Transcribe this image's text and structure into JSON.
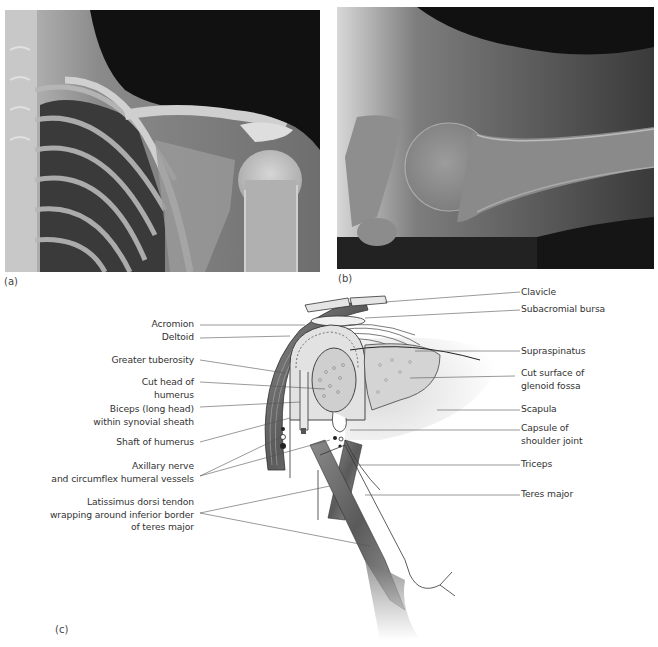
{
  "figure": {
    "panels": [
      {
        "id": "a",
        "label": "(a)",
        "type": "x-ray",
        "subject": "anteroposterior shoulder radiograph"
      },
      {
        "id": "b",
        "label": "(b)",
        "type": "x-ray",
        "subject": "axillary view of shoulder radiograph"
      },
      {
        "id": "c",
        "label": "(c)",
        "type": "illustration",
        "subject": "coronal section of shoulder joint"
      }
    ],
    "labels_left": [
      {
        "text": "Acromion"
      },
      {
        "text": "Deltoid"
      },
      {
        "text": "Greater tuberosity"
      },
      {
        "line1": "Cut head of",
        "line2": "humerus"
      },
      {
        "line1": "Biceps (long head)",
        "line2": "within synovial sheath"
      },
      {
        "text": "Shaft of humerus"
      },
      {
        "line1": "Axillary nerve",
        "line2": "and circumflex humeral vessels"
      },
      {
        "line1": "Latissimus dorsi tendon",
        "line2": "wrapping around inferior border",
        "line3": "of teres major"
      }
    ],
    "labels_right": [
      {
        "text": "Clavicle"
      },
      {
        "text": "Subacromial bursa"
      },
      {
        "text": "Supraspinatus"
      },
      {
        "line1": "Cut surface of",
        "line2": "glenoid fossa"
      },
      {
        "text": "Scapula"
      },
      {
        "line1": "Capsule of",
        "line2": "shoulder joint"
      },
      {
        "text": "Triceps"
      },
      {
        "text": "Teres major"
      }
    ]
  },
  "colors": {
    "label_text": "#333333",
    "leader_line": "#555555",
    "xray_dark": "#111111",
    "xray_bone": "#d8d8d8",
    "illustration_fill": "#d9d9d9",
    "muscle_dark": "#5a5a5a"
  }
}
